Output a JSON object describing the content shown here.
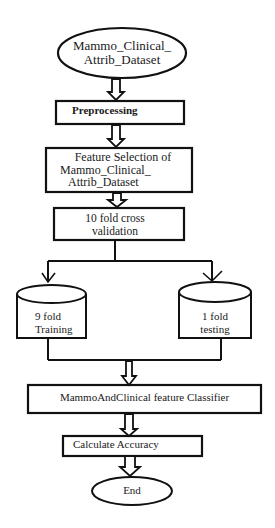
{
  "diagram": {
    "type": "flowchart",
    "nodes": {
      "start": {
        "shape": "ellipse",
        "line1": "Mammo_Clinical_",
        "line2": "Attrib_Dataset"
      },
      "preprocessing": {
        "shape": "rectangle",
        "label": "Preprocessing"
      },
      "feature_selection": {
        "shape": "rectangle",
        "line1": "Feature Selection of",
        "line2": "Mammo_Clinical_",
        "line3": "Attrib_Dataset"
      },
      "cross_validation": {
        "shape": "rectangle",
        "line1": "10 fold cross",
        "line2": "validation"
      },
      "training": {
        "shape": "cylinder",
        "line1": "9 fold",
        "line2": "Training"
      },
      "testing": {
        "shape": "cylinder",
        "line1": "1 fold",
        "line2": "testing"
      },
      "classifier": {
        "shape": "rectangle",
        "label": "MammoAndClinical feature Classifier"
      },
      "accuracy": {
        "shape": "rectangle",
        "label": "Calculate Accuracy"
      },
      "end": {
        "shape": "ellipse",
        "label": "End"
      }
    },
    "edges": [
      [
        "start",
        "preprocessing"
      ],
      [
        "preprocessing",
        "feature_selection"
      ],
      [
        "feature_selection",
        "cross_validation"
      ],
      [
        "cross_validation",
        "training"
      ],
      [
        "cross_validation",
        "testing"
      ],
      [
        "training",
        "classifier"
      ],
      [
        "testing",
        "classifier"
      ],
      [
        "classifier",
        "accuracy"
      ],
      [
        "accuracy",
        "end"
      ]
    ]
  }
}
